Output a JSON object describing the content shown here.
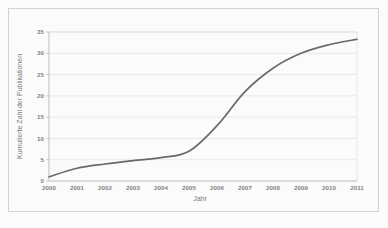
{
  "chart_data": {
    "type": "line",
    "title": "",
    "xlabel": "Jahr",
    "ylabel": "Kumulierte Zahl der Publikationen",
    "categories": [
      "2000",
      "2001",
      "2002",
      "2003",
      "2004",
      "2005",
      "2006",
      "2007",
      "2008",
      "2009",
      "2010",
      "2011"
    ],
    "x": [
      2000,
      2001,
      2002,
      2003,
      2004,
      2005,
      2006,
      2007,
      2008,
      2009,
      2010,
      2011
    ],
    "values": [
      1,
      3,
      4,
      4.8,
      5.5,
      7,
      13,
      21,
      26.5,
      30,
      32,
      33.3
    ],
    "series": [
      {
        "name": "Kumulierte Zahl der Publikationen",
        "values": [
          1,
          3,
          4,
          4.8,
          5.5,
          7,
          13,
          21,
          26.5,
          30,
          32,
          33.3
        ]
      }
    ],
    "ylim": [
      0,
      35
    ],
    "xlim": [
      2000,
      2011
    ],
    "yticks": [
      0,
      5,
      10,
      15,
      20,
      25,
      30,
      35
    ],
    "ytick_labels": [
      "0",
      "5",
      "10",
      "15",
      "20",
      "25",
      "30",
      "35"
    ],
    "xtick_labels": [
      "2000",
      "2001",
      "2002",
      "2003",
      "2004",
      "2005",
      "2006",
      "2007",
      "2008",
      "2009",
      "2010",
      "2011"
    ],
    "grid": "horizontal",
    "legend": "none",
    "line_color": "#2b2b2b",
    "grid_color": "#cfcfcf",
    "axis_color": "#9a9a9a"
  }
}
